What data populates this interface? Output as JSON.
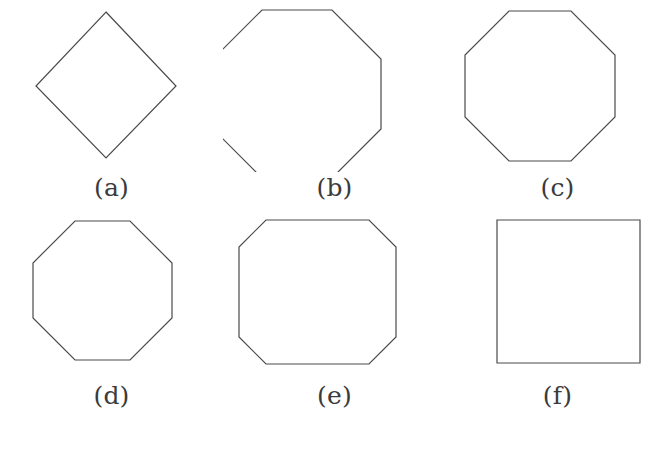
{
  "figure": {
    "background_color": "#ffffff",
    "stroke_color": "#4a4a4a",
    "caption_color": "#3b3b3b",
    "stroke_width": 1.2,
    "rows": 2,
    "columns": 3
  },
  "panels": [
    {
      "label": "(a)",
      "shape_name": "diamond",
      "sides": 4,
      "description": "square rotated 45 degrees",
      "points": "106,12 176,86 106,158 36,86"
    },
    {
      "label": "(b)",
      "shape_name": "regular-octagon",
      "sides": 8,
      "description": "regular octagon, flat top",
      "points": "39,10 109,10 158,59 158,129 109,178 39,178 -10,129 -10,59"
    },
    {
      "label": "(c)",
      "shape_name": "regular-octagon-wide",
      "sides": 8,
      "description": "regular octagon, slightly wider flat top",
      "points": "63,11 125,11 169,55 169,117 125,161 63,161 19,117 19,55"
    },
    {
      "label": "(d)",
      "shape_name": "octagon-short-edges",
      "sides": 8,
      "description": "octagon with short axis-aligned edges and long diagonals",
      "points": "75,13 130,13 172,55 172,110 130,152 75,152 33,110 33,55"
    },
    {
      "label": "(e)",
      "shape_name": "chamfered-square",
      "sides": 8,
      "description": "square with small cut corners",
      "points": "43,12 146,12 173,39 173,129 146,156 43,156 16,129 16,39"
    },
    {
      "label": "(f)",
      "shape_name": "square",
      "sides": 4,
      "description": "plain axis-aligned square",
      "points": "51,12 194,12 194,155 51,155"
    }
  ]
}
